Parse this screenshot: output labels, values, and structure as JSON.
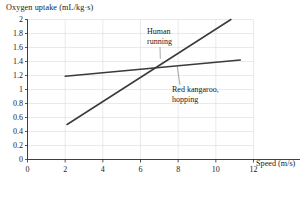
{
  "chart_data": {
    "type": "line",
    "title": "",
    "ylabel": "Oxygen uptake (mL/kg·s)",
    "xlabel": "Speed (m/s)",
    "xlim": [
      0,
      12
    ],
    "ylim": [
      0,
      2
    ],
    "xticks": [
      "0",
      "2",
      "4",
      "6",
      "8",
      "10",
      "12"
    ],
    "xtick_values": [
      0,
      2,
      4,
      6,
      8,
      10,
      12
    ],
    "yticks": [
      "0",
      "0.2",
      "0.4",
      "0.6",
      "0.8",
      "1",
      "1.2",
      "1.4",
      "1.6",
      "1.8",
      "2"
    ],
    "ytick_values": [
      0,
      0.2,
      0.4,
      0.6,
      0.8,
      1,
      1.2,
      1.4,
      1.6,
      1.8,
      2
    ],
    "grid": true,
    "legend": "annotations",
    "line_color": "#3a3a3a",
    "grid_color": "#d9dde2",
    "axis_color": "#2b2b2b",
    "series": [
      {
        "name": "Human running",
        "annotation": [
          "Human",
          "running"
        ],
        "x": [
          2.1,
          10.8
        ],
        "values": [
          0.5,
          2.0
        ]
      },
      {
        "name": "Red kangaroo, hopping",
        "annotation": [
          "Red kangaroo,",
          "hopping"
        ],
        "x": [
          2.0,
          11.3
        ],
        "values": [
          1.19,
          1.42
        ]
      }
    ],
    "annotations": [
      {
        "label_line1": "Human",
        "label_line2": "running",
        "target_x": 7.05,
        "target_y": 1.44
      },
      {
        "label_line1": "Red kangaroo,",
        "label_line2": "hopping",
        "target_x": 7.95,
        "target_y": 1.33
      }
    ]
  }
}
